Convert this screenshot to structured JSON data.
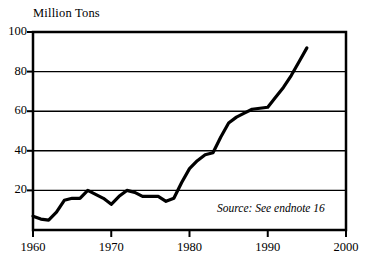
{
  "chart_data": {
    "type": "line",
    "title": "Million Tons",
    "xlabel": "",
    "ylabel": "Million Tons",
    "xlim": [
      1960,
      2000
    ],
    "ylim": [
      0,
      100
    ],
    "grid": true,
    "legend": false,
    "annotation": "Source: See endnote 16",
    "x_ticks": [
      "1960",
      "1970",
      "1980",
      "1990",
      "2000"
    ],
    "x_tick_values": [
      1960,
      1970,
      1980,
      1990,
      2000
    ],
    "y_ticks": [
      "20",
      "40",
      "60",
      "80",
      "100"
    ],
    "y_tick_values": [
      20,
      40,
      60,
      80,
      100
    ],
    "series": [
      {
        "name": "Million Tons",
        "color": "#000000",
        "x": [
          1960,
          1961,
          1962,
          1963,
          1964,
          1965,
          1966,
          1967,
          1968,
          1969,
          1970,
          1971,
          1972,
          1973,
          1974,
          1975,
          1976,
          1977,
          1978,
          1979,
          1980,
          1981,
          1982,
          1983,
          1984,
          1985,
          1986,
          1987,
          1988,
          1989,
          1990,
          1991,
          1992,
          1993,
          1994,
          1995
        ],
        "values": [
          7,
          5.5,
          5,
          9,
          15,
          16,
          16,
          20,
          18,
          16,
          13,
          17,
          20,
          19,
          17,
          17,
          17,
          14.5,
          16,
          24,
          31,
          35,
          38,
          39,
          47,
          54,
          57,
          59,
          61,
          61.5,
          62,
          67,
          72,
          78,
          85,
          92
        ]
      }
    ]
  },
  "axes": {
    "y_label_positions": [
      33,
      72,
      112,
      151,
      190
    ],
    "x_label_positions": [
      33,
      111,
      189,
      267,
      346
    ]
  }
}
